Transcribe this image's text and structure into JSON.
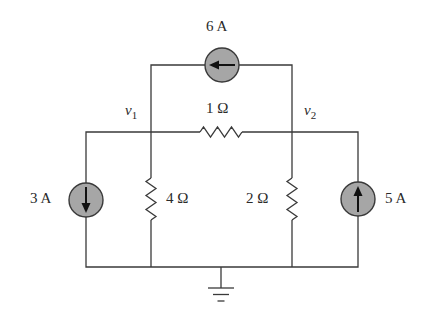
{
  "diagram": {
    "type": "circuit-schematic",
    "nodes": {
      "v1": {
        "label": "v",
        "sub": "1"
      },
      "v2": {
        "label": "v",
        "sub": "2"
      }
    },
    "components": {
      "source_top": {
        "label": "6 A",
        "kind": "current-source",
        "direction": "left"
      },
      "source_left": {
        "label": "3 A",
        "kind": "current-source",
        "direction": "down"
      },
      "source_right": {
        "label": "5 A",
        "kind": "current-source",
        "direction": "up"
      },
      "r_top": {
        "label": "1 Ω",
        "kind": "resistor"
      },
      "r_left": {
        "label": "4 Ω",
        "kind": "resistor"
      },
      "r_right": {
        "label": "2 Ω",
        "kind": "resistor"
      }
    },
    "ground": {
      "label": "ground"
    },
    "colors": {
      "wire": "#3a3a3a",
      "source_fill": "#a6a6a6",
      "arrow": "#111111",
      "text": "#2a2a2a"
    }
  }
}
